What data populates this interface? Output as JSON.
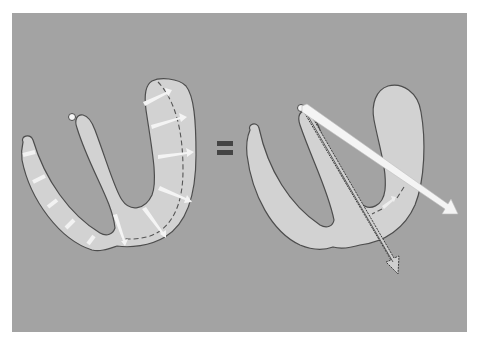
{
  "figure": {
    "background_color": "#a3a3a3",
    "wall_color": "#d2d2d2",
    "outline_color": "#4d4d4d",
    "arrow_color": "#f4f4f4",
    "equals_color": "#444444"
  },
  "left_heart": {
    "label": "",
    "segment_arrows": 10,
    "has_dashed_contour": true
  },
  "equals_sign": {
    "symbol": "="
  },
  "right_heart": {
    "label": "",
    "resultant_vectors": [
      {
        "name": "white-resultant-arrow",
        "style": "solid white",
        "direction": "down-right"
      },
      {
        "name": "outlined-resultant-arrow",
        "style": "outlined",
        "direction": "down"
      }
    ]
  }
}
